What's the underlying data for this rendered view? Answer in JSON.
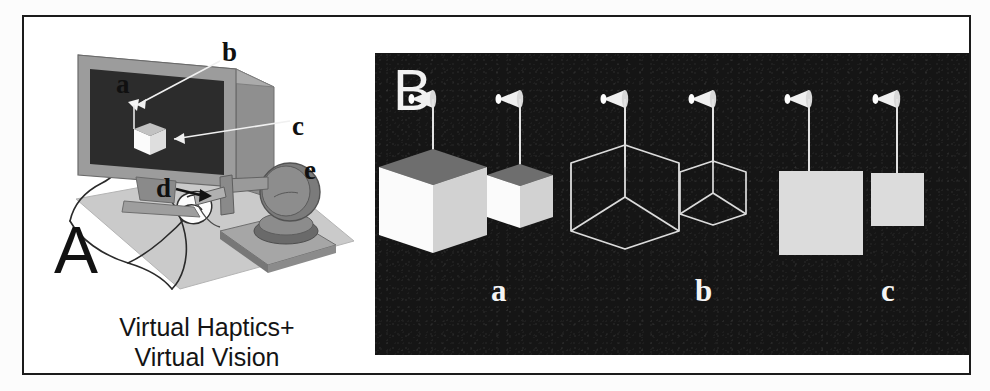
{
  "figure": {
    "panels": [
      {
        "id": "A",
        "letter": "A",
        "caption_line1": "Virtual Haptics+",
        "caption_line2": "Virtual Vision",
        "callouts": [
          {
            "key": "a",
            "label": "a",
            "refers_to": "observer-head"
          },
          {
            "key": "b",
            "label": "b",
            "refers_to": "virtual-cursor-on-screen"
          },
          {
            "key": "c",
            "label": "c",
            "refers_to": "virtual-cube-on-screen"
          },
          {
            "key": "d",
            "label": "d",
            "refers_to": "stylus-held-in-hand"
          },
          {
            "key": "e",
            "label": "e",
            "refers_to": "haptic-force-feedback-device"
          }
        ]
      },
      {
        "id": "B",
        "letter": "B",
        "background_color": "#151515",
        "sublabels": [
          {
            "key": "a",
            "label": "a",
            "condition": "solid-shaded-cubes"
          },
          {
            "key": "b",
            "label": "b",
            "condition": "wireframe-cubes"
          },
          {
            "key": "c",
            "label": "c",
            "condition": "flat-squares"
          }
        ],
        "stimuli": [
          {
            "group": "a",
            "size": "large",
            "type": "solid-cube"
          },
          {
            "group": "a",
            "size": "small",
            "type": "solid-cube"
          },
          {
            "group": "b",
            "size": "large",
            "type": "wireframe-cube"
          },
          {
            "group": "b",
            "size": "small",
            "type": "wireframe-cube"
          },
          {
            "group": "c",
            "size": "large",
            "type": "flat-square"
          },
          {
            "group": "c",
            "size": "small",
            "type": "flat-square"
          }
        ],
        "cursor_icon": "cone-probe-cursor"
      }
    ],
    "colors": {
      "frame_stroke": "#1b1b1b",
      "page_background": "#ffffff",
      "panel_b_background": "#151515",
      "cube_top_face": "#6e6e6e",
      "cube_left_face": "#fbfbfb",
      "cube_right_face": "#d2d2d2",
      "wireframe_stroke": "#dcdcdc",
      "flat_square_fill": "#dcdcdc",
      "monitor_bezel": "#9a9a9a",
      "monitor_screen": "#2a2a2a",
      "desk_surface": "#c9c9c9",
      "device_body": "#7d7d7d",
      "label_dark": "#101010",
      "label_light": "#f4f4f4"
    }
  }
}
